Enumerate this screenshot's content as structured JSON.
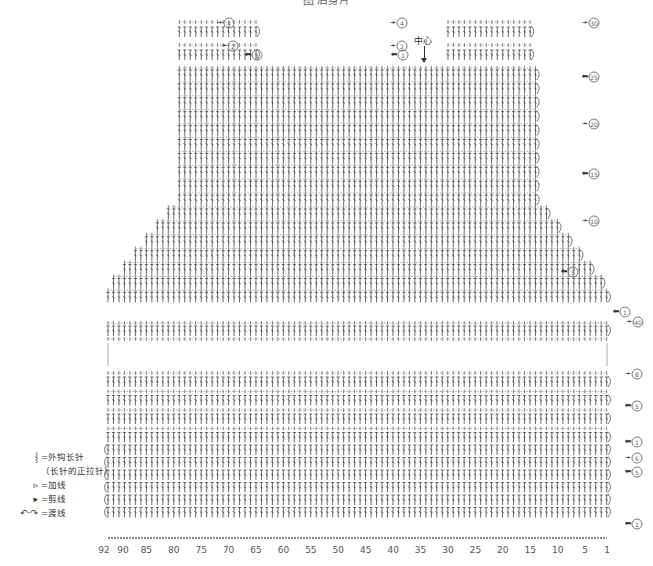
{
  "title": "图   后身片",
  "center_label": "中心",
  "legend": [
    {
      "icon": "front-post-double-crochet-icon",
      "symbol": "ʃ",
      "label": "=外钩长针",
      "sub": "（长针的正拉针）"
    },
    {
      "icon": "join-yarn-icon",
      "symbol": "▹",
      "label": "=加线"
    },
    {
      "icon": "cut-yarn-icon",
      "symbol": "▸",
      "label": "=剪线"
    },
    {
      "icon": "carry-yarn-icon",
      "symbol": "↶·↷",
      "label": "=渡线"
    }
  ],
  "chart_data": {
    "type": "crochet-chart",
    "title": "图   后身片",
    "xlabel": "stitch number",
    "x_ticks": [
      "92",
      "90",
      "85",
      "80",
      "75",
      "70",
      "65",
      "60",
      "55",
      "50",
      "45",
      "40",
      "35",
      "30",
      "25",
      "20",
      "15",
      "10",
      "5",
      "1"
    ],
    "x_range": [
      92,
      1
    ],
    "center_stitch": 46,
    "upper_section": {
      "name": "yoke",
      "row_labels": [
        {
          "label": "④",
          "side": "left-shoulder",
          "direction": "right"
        },
        {
          "label": "②",
          "side": "left-shoulder",
          "direction": "right"
        },
        {
          "label": "①",
          "side": "left-shoulder",
          "direction": "left"
        },
        {
          "label": "④",
          "side": "right-shoulder",
          "direction": "right"
        },
        {
          "label": "②",
          "side": "right-shoulder",
          "direction": "right"
        },
        {
          "label": "①",
          "side": "right-shoulder",
          "direction": "left"
        },
        {
          "label": "30",
          "side": "right",
          "direction": "right"
        },
        {
          "label": "25",
          "side": "right",
          "direction": "left"
        },
        {
          "label": "20",
          "side": "right",
          "direction": "right"
        },
        {
          "label": "15",
          "side": "right",
          "direction": "left"
        },
        {
          "label": "10",
          "side": "right",
          "direction": "right"
        },
        {
          "label": "5",
          "side": "right",
          "direction": "left"
        },
        {
          "label": "1",
          "side": "right",
          "direction": "left"
        },
        {
          "label": "40",
          "side": "right",
          "direction": "right"
        }
      ]
    },
    "lower_section": {
      "name": "body",
      "row_labels": [
        {
          "label": "8",
          "direction": "right"
        },
        {
          "label": "5",
          "direction": "left"
        },
        {
          "label": "1",
          "direction": "left"
        },
        {
          "label": "6",
          "direction": "right"
        },
        {
          "label": "5",
          "direction": "left"
        },
        {
          "label": "1",
          "direction": "left"
        }
      ]
    }
  }
}
